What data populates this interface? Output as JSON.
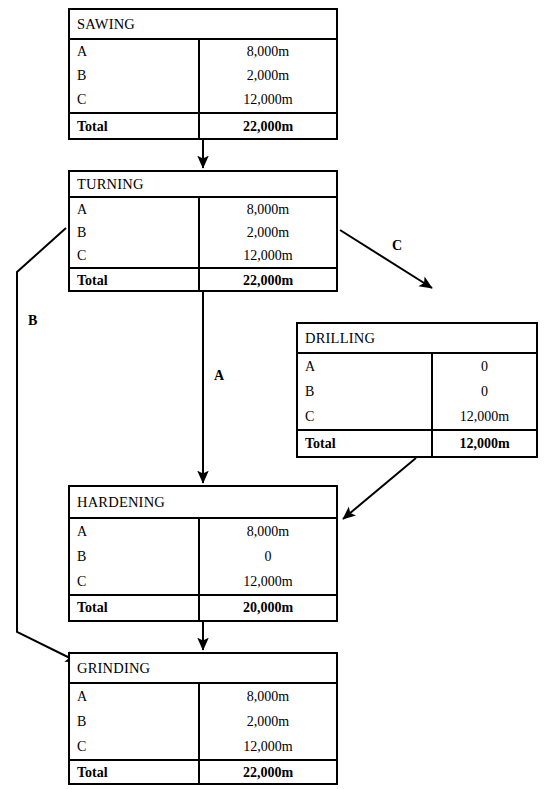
{
  "diagram": {
    "row_labels": [
      "A",
      "B",
      "C"
    ],
    "total_label": "Total",
    "tables": [
      {
        "id": "sawing",
        "name": "SAWING",
        "rows": [
          {
            "label": "A",
            "value": "8,000m"
          },
          {
            "label": "B",
            "value": "2,000m"
          },
          {
            "label": "C",
            "value": "12,000m"
          }
        ],
        "total": {
          "label": "Total",
          "value": "22,000m"
        }
      },
      {
        "id": "turning",
        "name": "TURNING",
        "rows": [
          {
            "label": "A",
            "value": "8,000m"
          },
          {
            "label": "B",
            "value": "2,000m"
          },
          {
            "label": "C",
            "value": "12,000m"
          }
        ],
        "total": {
          "label": "Total",
          "value": "22,000m"
        }
      },
      {
        "id": "drilling",
        "name": "DRILLING",
        "rows": [
          {
            "label": "A",
            "value": "0"
          },
          {
            "label": "B",
            "value": "0"
          },
          {
            "label": "C",
            "value": "12,000m"
          }
        ],
        "total": {
          "label": "Total",
          "value": "12,000m"
        }
      },
      {
        "id": "hardening",
        "name": "HARDENING",
        "rows": [
          {
            "label": "A",
            "value": "8,000m"
          },
          {
            "label": "B",
            "value": "0"
          },
          {
            "label": "C",
            "value": "12,000m"
          }
        ],
        "total": {
          "label": "Total",
          "value": "20,000m"
        }
      },
      {
        "id": "grinding",
        "name": "GRINDING",
        "rows": [
          {
            "label": "A",
            "value": "8,000m"
          },
          {
            "label": "B",
            "value": "2,000m"
          },
          {
            "label": "C",
            "value": "12,000m"
          }
        ],
        "total": {
          "label": "Total",
          "value": "22,000m"
        }
      }
    ],
    "connector_labels": [
      {
        "id": "c-branch",
        "text": "C"
      },
      {
        "id": "b-branch",
        "text": "B"
      },
      {
        "id": "a-branch",
        "text": "A"
      }
    ],
    "colors": {
      "line": "#000000",
      "background": "#ffffff",
      "text": "#000000"
    }
  }
}
